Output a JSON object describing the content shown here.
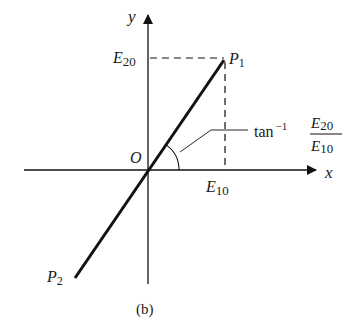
{
  "figure": {
    "caption": "(b)",
    "axes": {
      "x_label": "x",
      "y_label": "y",
      "origin_label": "O"
    },
    "points": {
      "p1": {
        "base": "P",
        "sub": "1"
      },
      "p2": {
        "base": "P",
        "sub": "2"
      }
    },
    "projections": {
      "e20": {
        "base": "E",
        "sub": "20"
      },
      "e10": {
        "base": "E",
        "sub": "10"
      }
    },
    "angle_annotation": {
      "func": "tan",
      "sup": "−1",
      "num_base": "E",
      "num_sub": "20",
      "den_base": "E",
      "den_sub": "10"
    }
  }
}
